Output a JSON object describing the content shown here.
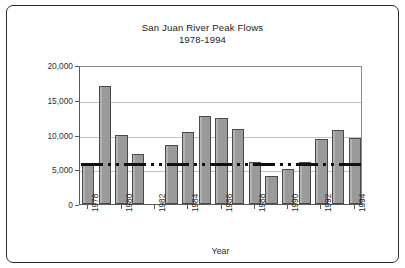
{
  "chart_data": {
    "type": "bar",
    "title": "San Juan River Peak Flows",
    "subtitle": "1978-1994",
    "xlabel": "Year",
    "ylabel": "Peak Flow (cfs)",
    "ylim": [
      0,
      20000
    ],
    "yticks": [
      0,
      5000,
      10000,
      15000,
      20000
    ],
    "ytick_labels": [
      "0",
      "5,000",
      "10,000",
      "15,000",
      "20,000"
    ],
    "grid": true,
    "legend": "none",
    "categories": [
      "1978",
      "1979",
      "1980",
      "1981",
      "1982",
      "1983",
      "1984",
      "1985",
      "1986",
      "1987",
      "1988",
      "1989",
      "1990",
      "1991",
      "1992",
      "1993",
      "1994"
    ],
    "xtick_labels": [
      "1978",
      "1980",
      "1982",
      "1984",
      "1986",
      "1988",
      "1990",
      "1992",
      "1994"
    ],
    "values": [
      5900,
      17000,
      10000,
      7200,
      null,
      8500,
      10400,
      12700,
      12400,
      10800,
      6000,
      4000,
      5100,
      6000,
      9300,
      10600,
      9500
    ],
    "missing_categories": [
      "1982"
    ],
    "annotations": [
      {
        "type": "threshold-line",
        "label": "",
        "value": 6000,
        "style": "dash-dot",
        "color": "#101010"
      }
    ],
    "series": [
      {
        "name": "Peak Flow",
        "color": "#9a9a9a",
        "edge_color": "#4a4a4a",
        "values": [
          5900,
          17000,
          10000,
          7200,
          null,
          8500,
          10400,
          12700,
          12400,
          10800,
          6000,
          4000,
          5100,
          6000,
          9300,
          10600,
          9500
        ]
      }
    ]
  },
  "colors": {
    "bar_fill": "#9a9a9a",
    "bar_edge": "#4a4a4a",
    "grid": "#c2c2c2",
    "axis": "#5a5a5a",
    "threshold": "#101010",
    "frame": "#2b2b2b",
    "background": "#ffffff"
  }
}
